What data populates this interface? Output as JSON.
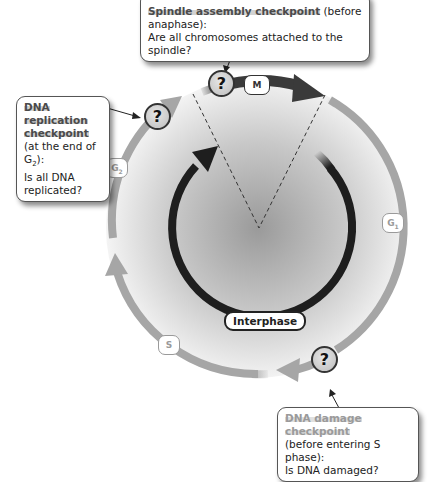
{
  "diagram": {
    "phases": {
      "m": "M",
      "g1_base": "G",
      "g1_sub": "1",
      "s": "S",
      "g2_base": "G",
      "g2_sub": "2",
      "interphase": "Interphase"
    },
    "checkpoint_symbol": "?",
    "callouts": {
      "spindle": {
        "title": "Spindle assembly checkpoint",
        "qualifier": " (before anaphase):",
        "question": "Are all chromosomes attached to the spindle?"
      },
      "replication": {
        "title_line1": "DNA replication",
        "title_line2": "checkpoint",
        "qualifier_pre": "(at the end of G",
        "qualifier_sub": "2",
        "qualifier_post": "):",
        "question_line1": "Is all DNA",
        "question_line2": "replicated?"
      },
      "damage": {
        "title": "DNA damage checkpoint",
        "qualifier": "(before entering S phase):",
        "question": "Is DNA damaged?"
      }
    },
    "colors": {
      "outer_ring": "#a6a6a6",
      "inner_ring": "#1e1e1e",
      "mitosis_arrow": "#3a3a3a",
      "center_shade": "#9e9e9e",
      "dashed_line": "#333333"
    }
  }
}
